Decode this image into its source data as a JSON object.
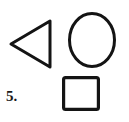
{
  "page": {
    "background_color": "#ffffff",
    "ink_color": "#141414",
    "width": 129,
    "height": 122
  },
  "item": {
    "number_label": "5.",
    "kind": "worksheet-item"
  },
  "figure": {
    "stroke_color": "#141414",
    "fill": "none",
    "shapes": [
      {
        "name": "triangle",
        "label": "triangle",
        "orientation": "points-left",
        "stroke_width": 3.0,
        "points": "50,21 50,67 11,44",
        "bbox": [
          11,
          21,
          39,
          46
        ]
      },
      {
        "name": "circle",
        "label": "circle",
        "stroke_width": 3.0,
        "cx": 92,
        "cy": 40,
        "rx": 24,
        "ry": 28,
        "bbox": [
          68,
          12,
          48,
          56
        ]
      },
      {
        "name": "square",
        "label": "square",
        "stroke_width": 3.2,
        "x": 62,
        "y": 76,
        "width": 38,
        "height": 35,
        "corner_radius": 2,
        "bbox": [
          62,
          76,
          38,
          35
        ]
      }
    ]
  }
}
